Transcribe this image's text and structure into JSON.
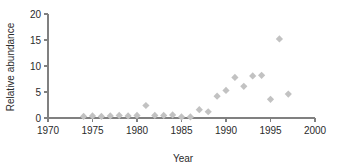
{
  "chart_data": {
    "type": "scatter",
    "title": "",
    "xlabel": "Year",
    "ylabel": "Relative abundance",
    "xlim": [
      1970,
      2000
    ],
    "ylim": [
      0,
      20
    ],
    "xticks": [
      1970,
      1975,
      1980,
      1985,
      1990,
      1995,
      2000
    ],
    "yticks": [
      0,
      5,
      10,
      15,
      20
    ],
    "xtick_labels": [
      "1970",
      "1975",
      "1980",
      "1985",
      "1990",
      "1995",
      "2000"
    ],
    "ytick_labels": [
      "0",
      "5",
      "10",
      "15",
      "20"
    ],
    "grid": false,
    "legend": false,
    "marker": "diamond",
    "marker_color": "#c2c2c2",
    "series": [
      {
        "name": "Relative abundance",
        "x": [
          1974,
          1975,
          1976,
          1977,
          1978,
          1979,
          1980,
          1981,
          1982,
          1983,
          1984,
          1985,
          1986,
          1987,
          1988,
          1989,
          1990,
          1991,
          1992,
          1993,
          1994,
          1995,
          1996,
          1997
        ],
        "y": [
          0.3,
          0.4,
          0.3,
          0.4,
          0.5,
          0.4,
          0.5,
          2.4,
          0.5,
          0.5,
          0.6,
          0.2,
          0.2,
          1.6,
          1.2,
          4.2,
          5.3,
          7.8,
          6.1,
          8.1,
          8.2,
          3.6,
          15.2,
          4.6
        ]
      }
    ]
  },
  "axes": {
    "y_title": "Relative abundance",
    "x_title": "Year"
  }
}
